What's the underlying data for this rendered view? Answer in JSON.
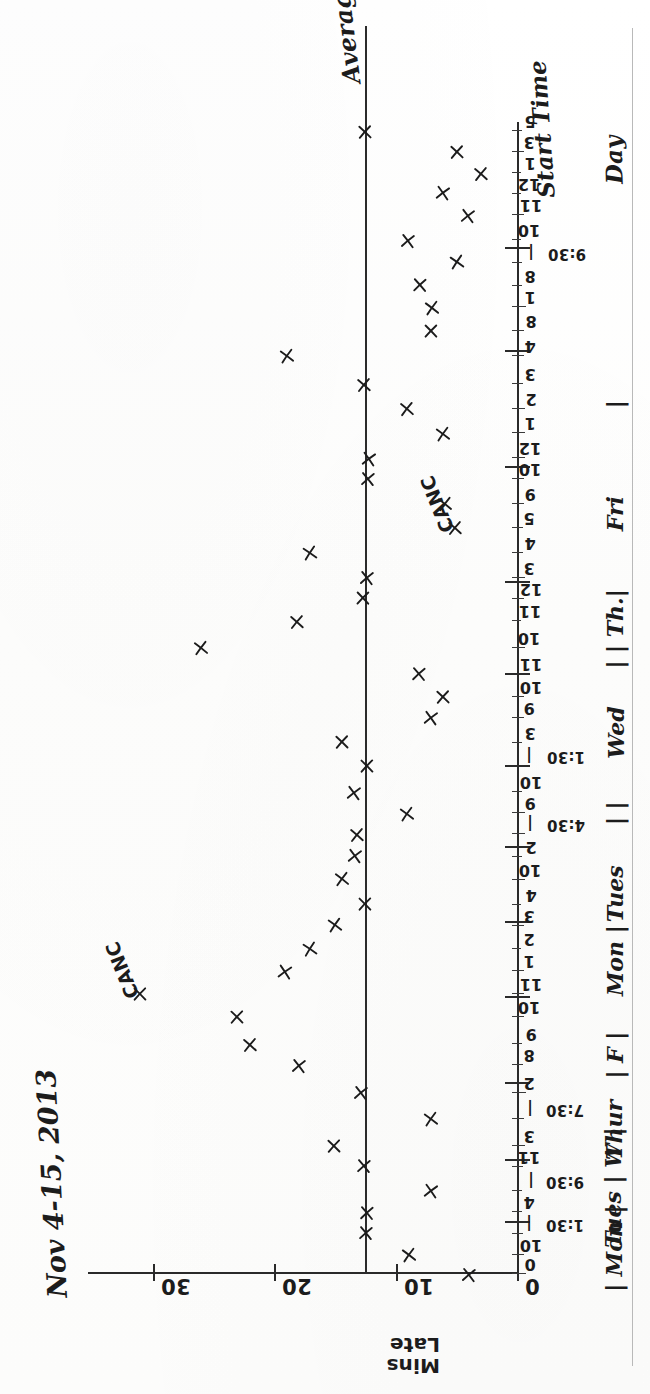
{
  "title": "Nov 4-15, 2013",
  "axes": {
    "y_label_line1": "Mins",
    "y_label_line2": "Late",
    "y_ticks": [
      "30",
      "20",
      "10",
      "0"
    ],
    "x_caption_top": "Start Time",
    "x_caption_bottom": "Day"
  },
  "average": {
    "label": "Average",
    "value": 12.5
  },
  "annotations": [
    {
      "text": "CANC",
      "day": "Thur",
      "note": "cancelled flight marker"
    },
    {
      "text": "CANC",
      "day": "Tues",
      "note": "cancelled flight marker"
    }
  ],
  "day_labels": [
    "| Mon |",
    "Tues | W |",
    "Thur",
    "| F |",
    "Mon |",
    "Tues",
    "| |",
    "Wed",
    "| | Th.|",
    "Fri",
    "|"
  ],
  "hour_tick_labels": [
    "0",
    "10",
    "|",
    "4",
    "|",
    "11",
    "3",
    "|",
    "2",
    "8",
    "9",
    "10",
    "11",
    "1",
    "2",
    "3",
    "4",
    "10",
    "2",
    "|",
    "9",
    "10",
    "|",
    "3",
    "9",
    "10",
    "11",
    "10",
    "11",
    "12",
    "3",
    "4",
    "5",
    "9",
    "10",
    "12",
    "1",
    "2",
    "3",
    "4",
    "8",
    "1",
    "8",
    "|",
    "10",
    "11",
    "12",
    "1",
    "3",
    "5"
  ],
  "time_labels": [
    "1:30",
    "9:30",
    "7:30",
    "4:30",
    "1:30",
    "9:30"
  ],
  "chart_data": {
    "type": "scatter",
    "title": "Nov 4-15, 2013",
    "xlabel": "Start Time / Day",
    "ylabel": "Mins Late",
    "ylim": [
      0,
      35
    ],
    "yticks": [
      0,
      10,
      20,
      30
    ],
    "grid": false,
    "legend": "none",
    "average_line": 12.5,
    "x_tick_labels": [
      "0",
      "10",
      "|",
      "4",
      "|",
      "11",
      "3",
      "|",
      "2",
      "8",
      "9",
      "10",
      "11",
      "1",
      "2",
      "3",
      "4",
      "10",
      "2",
      "|",
      "9",
      "10",
      "|",
      "3",
      "9",
      "10",
      "11",
      "10",
      "11",
      "12",
      "3",
      "4",
      "5",
      "9",
      "10",
      "12",
      "1",
      "2",
      "3",
      "4",
      "8",
      "1",
      "8",
      "|",
      "10",
      "11",
      "12",
      "1",
      "3",
      "5"
    ],
    "day_groups": [
      "Mon",
      "Tues",
      "W",
      "Thur",
      "F",
      "Mon",
      "Tues",
      "Wed",
      "Th.",
      "Fri"
    ],
    "points": [
      {
        "i": 0,
        "x": 0,
        "y": 4,
        "label": "0"
      },
      {
        "i": 1,
        "x": 22,
        "y": 9,
        "label": "10"
      },
      {
        "i": 2,
        "x": 46,
        "y": 12.5,
        "label": "1:30"
      },
      {
        "i": 3,
        "x": 70,
        "y": 12.3,
        "label": "4"
      },
      {
        "i": 4,
        "x": 94,
        "y": 7,
        "label": "9:30"
      },
      {
        "i": 5,
        "x": 122,
        "y": 12.6,
        "label": "11"
      },
      {
        "i": 6,
        "x": 146,
        "y": 15,
        "label": "3"
      },
      {
        "i": 7,
        "x": 176,
        "y": 7,
        "label": "7:30"
      },
      {
        "i": 8,
        "x": 206,
        "y": 12.8,
        "label": "2"
      },
      {
        "i": 9,
        "x": 238,
        "y": 18,
        "label": "8"
      },
      {
        "i": 10,
        "x": 262,
        "y": 22,
        "label": "9"
      },
      {
        "i": 11,
        "x": 292,
        "y": 23,
        "label": "10"
      },
      {
        "i": 12,
        "x": 318,
        "y": 31,
        "label": "11 CANC"
      },
      {
        "i": 13,
        "x": 344,
        "y": 19,
        "label": "1"
      },
      {
        "i": 14,
        "x": 370,
        "y": 17,
        "label": "2"
      },
      {
        "i": 15,
        "x": 396,
        "y": 15,
        "label": "3"
      },
      {
        "i": 16,
        "x": 420,
        "y": 12.5,
        "label": "4"
      },
      {
        "i": 17,
        "x": 448,
        "y": 14.5,
        "label": "10"
      },
      {
        "i": 18,
        "x": 474,
        "y": 13.3,
        "label": "2"
      },
      {
        "i": 19,
        "x": 500,
        "y": 13.1,
        "label": "4:30"
      },
      {
        "i": 20,
        "x": 524,
        "y": 9,
        "label": "9"
      },
      {
        "i": 21,
        "x": 548,
        "y": 13.4,
        "label": "10"
      },
      {
        "i": 22,
        "x": 578,
        "y": 12.4,
        "label": "1:30"
      },
      {
        "i": 23,
        "x": 604,
        "y": 14.5,
        "label": "3"
      },
      {
        "i": 24,
        "x": 632,
        "y": 7,
        "label": "9"
      },
      {
        "i": 25,
        "x": 656,
        "y": 6,
        "label": "10"
      },
      {
        "i": 26,
        "x": 682,
        "y": 8,
        "label": "11"
      },
      {
        "i": 27,
        "x": 712,
        "y": 26,
        "label": "10"
      },
      {
        "i": 28,
        "x": 742,
        "y": 18,
        "label": "11"
      },
      {
        "i": 29,
        "x": 768,
        "y": 12.6,
        "label": "12"
      },
      {
        "i": 30,
        "x": 792,
        "y": 12.4,
        "label": "3"
      },
      {
        "i": 31,
        "x": 820,
        "y": 17,
        "label": "4"
      },
      {
        "i": 32,
        "x": 848,
        "y": 5,
        "label": "5 CANC"
      },
      {
        "i": 33,
        "x": 876,
        "y": 6,
        "label": "9"
      },
      {
        "i": 34,
        "x": 904,
        "y": 12.3,
        "label": "10"
      },
      {
        "i": 35,
        "x": 928,
        "y": 12.2,
        "label": "12"
      },
      {
        "i": 36,
        "x": 956,
        "y": 6,
        "label": "1"
      },
      {
        "i": 37,
        "x": 984,
        "y": 9,
        "label": "2"
      },
      {
        "i": 38,
        "x": 1012,
        "y": 12.5,
        "label": "3"
      },
      {
        "i": 39,
        "x": 1044,
        "y": 19,
        "label": "4"
      },
      {
        "i": 40,
        "x": 1072,
        "y": 7,
        "label": "8"
      },
      {
        "i": 41,
        "x": 1100,
        "y": 7,
        "label": "1"
      },
      {
        "i": 42,
        "x": 1124,
        "y": 8,
        "label": "8"
      },
      {
        "i": 43,
        "x": 1150,
        "y": 5,
        "label": "9:30"
      },
      {
        "i": 44,
        "x": 1176,
        "y": 9,
        "label": "10"
      },
      {
        "i": 45,
        "x": 1204,
        "y": 4,
        "label": "11"
      },
      {
        "i": 46,
        "x": 1228,
        "y": 6,
        "label": "12"
      },
      {
        "i": 47,
        "x": 1252,
        "y": 3,
        "label": "1"
      },
      {
        "i": 48,
        "x": 1276,
        "y": 5,
        "label": "3"
      },
      {
        "i": 49,
        "x": 1300,
        "y": 12.5,
        "label": "5"
      }
    ]
  }
}
